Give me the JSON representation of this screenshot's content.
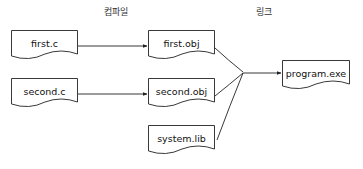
{
  "diagram": {
    "type": "flowchart",
    "stages": [
      {
        "id": "compile",
        "label": "컴파일",
        "x": 116,
        "y": 5
      },
      {
        "id": "link",
        "label": "링크",
        "x": 264,
        "y": 5
      }
    ],
    "nodes": [
      {
        "id": "first_c",
        "label": "first.c",
        "shape": "document",
        "x": 11,
        "y": 30,
        "w": 67,
        "h": 33
      },
      {
        "id": "second_c",
        "label": "second.c",
        "shape": "document",
        "x": 11,
        "y": 78,
        "w": 67,
        "h": 33
      },
      {
        "id": "first_obj",
        "label": "first.obj",
        "shape": "document",
        "x": 148,
        "y": 30,
        "w": 67,
        "h": 33
      },
      {
        "id": "second_obj",
        "label": "second.obj",
        "shape": "document",
        "x": 148,
        "y": 78,
        "w": 67,
        "h": 33
      },
      {
        "id": "system_lib",
        "label": "system.lib",
        "shape": "document",
        "x": 148,
        "y": 125,
        "w": 67,
        "h": 33
      },
      {
        "id": "program_exe",
        "label": "program.exe",
        "shape": "document",
        "x": 282,
        "y": 60,
        "w": 68,
        "h": 33
      }
    ],
    "edges": [
      {
        "from": "first_c",
        "to": "first_obj",
        "label": ""
      },
      {
        "from": "second_c",
        "to": "second_obj",
        "label": ""
      },
      {
        "from": "first_obj",
        "to": "program_exe",
        "label": ""
      },
      {
        "from": "second_obj",
        "to": "program_exe",
        "label": ""
      },
      {
        "from": "system_lib",
        "to": "program_exe",
        "label": ""
      }
    ],
    "colors": {
      "stroke": "#222222",
      "text": "#111111",
      "background": "#ffffff"
    }
  }
}
